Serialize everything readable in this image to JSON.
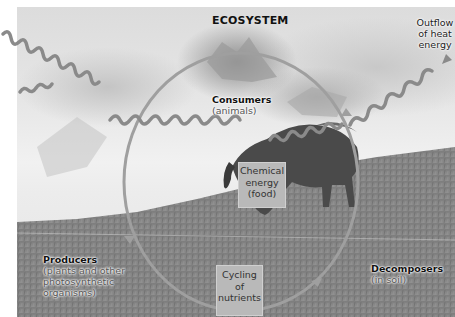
{
  "diagram": {
    "title": "ECOSYSTEM",
    "heat_outflow": {
      "line1": "Outflow",
      "line2": "of heat",
      "line3": "energy"
    },
    "consumers": {
      "name": "Consumers",
      "desc": "(animals)"
    },
    "chemical_energy": {
      "line1": "Chemical",
      "line2": "energy",
      "line3": "(food)"
    },
    "producers": {
      "name": "Producers",
      "desc_line1": "(plants and other",
      "desc_line2": "photosynthetic",
      "desc_line3": "organisms)"
    },
    "decomposers": {
      "name": "Decomposers",
      "desc": "(in soil)"
    },
    "nutrient_cycling": {
      "line1": "Cycling",
      "line2": "of",
      "line3": "nutrients"
    },
    "colors": {
      "cycle_ring": "#9a9a9a",
      "energy_wave": "#8a8a8a",
      "box_fill": "#b9b9b9"
    }
  }
}
